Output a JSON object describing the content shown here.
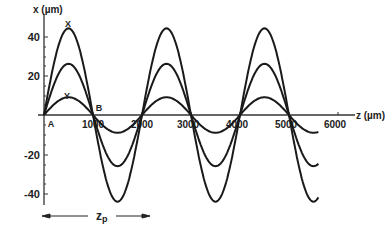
{
  "chart_data": {
    "type": "line",
    "title": "",
    "xlabel": "z (µm)",
    "ylabel": "x (µm)",
    "xlim": [
      0,
      6300
    ],
    "ylim": [
      -46,
      46
    ],
    "x_ticks": [
      0,
      1000,
      2000,
      3000,
      4000,
      5000,
      6000
    ],
    "x_tick_labels": [
      "1000",
      "2000",
      "3000",
      "4000",
      "5000",
      "6000"
    ],
    "y_ticks": [
      -40,
      -20,
      0,
      20,
      40
    ],
    "y_tick_labels": [
      "-40",
      "-20",
      "20",
      "40"
    ],
    "grid": false,
    "legend": null,
    "period_um": 2000,
    "series": [
      {
        "name": "trajectory 1 (X)",
        "amplitude": 44,
        "function": "44*sin(2*pi*z/2000)"
      },
      {
        "name": "trajectory 2",
        "amplitude": 26,
        "function": "26*sin(2*pi*z/2000)"
      },
      {
        "name": "trajectory 3 (Y)",
        "amplitude": 9,
        "function": "9*sin(2*pi*z/2000)"
      }
    ],
    "x": [
      0,
      500,
      1000,
      1500,
      2000,
      2500,
      3000,
      3500,
      4000,
      4500,
      5000,
      5500,
      6000,
      6300
    ],
    "series_values": [
      [
        0,
        44,
        0,
        -44,
        0,
        44,
        0,
        -44,
        0,
        44,
        0,
        -44,
        0,
        -36
      ],
      [
        0,
        26,
        0,
        -26,
        0,
        26,
        0,
        -26,
        0,
        26,
        0,
        -26,
        0,
        -21
      ],
      [
        0,
        9,
        0,
        -9,
        0,
        9,
        0,
        -9,
        0,
        9,
        0,
        -9,
        0,
        -7
      ]
    ],
    "annotations": [
      {
        "text": "X",
        "at": "first peak of largest trajectory"
      },
      {
        "text": "Y",
        "at": "first peak of smallest trajectory"
      },
      {
        "text": "A",
        "at": "origin (z=0)"
      },
      {
        "text": "B",
        "at": "z=1000 crossing"
      },
      {
        "text": "z_p",
        "at": "double arrow spanning one period (0 to 2000)"
      }
    ]
  },
  "labels": {
    "y_axis": "x (µm)",
    "x_axis": "z (µm)",
    "point_x": "X",
    "point_y": "Y",
    "point_a": "A",
    "point_b": "B",
    "period_main": "z",
    "period_sub": "p"
  },
  "ticks": {
    "y": [
      "40",
      "20",
      "-20",
      "-40"
    ],
    "x": [
      "1000",
      "2000",
      "3000",
      "4000",
      "5000",
      "6000"
    ]
  }
}
